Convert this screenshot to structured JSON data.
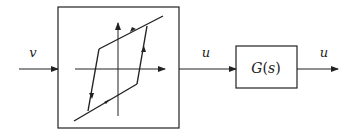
{
  "diagram": {
    "type": "block-diagram",
    "colors": {
      "stroke": "#222222",
      "background": "#ffffff"
    },
    "input_signal": {
      "label": "v"
    },
    "hysteresis_block": {
      "description": "hysteresis nonlinearity (backlash loop with directional arrows)",
      "icon": "hysteresis-loop-icon"
    },
    "intermediate_signal": {
      "label": "u"
    },
    "transfer_block": {
      "label": "G(s)",
      "label_parts": {
        "fn": "G",
        "open": "(",
        "var": "s",
        "close": ")"
      }
    },
    "output_signal": {
      "label": "u"
    }
  }
}
